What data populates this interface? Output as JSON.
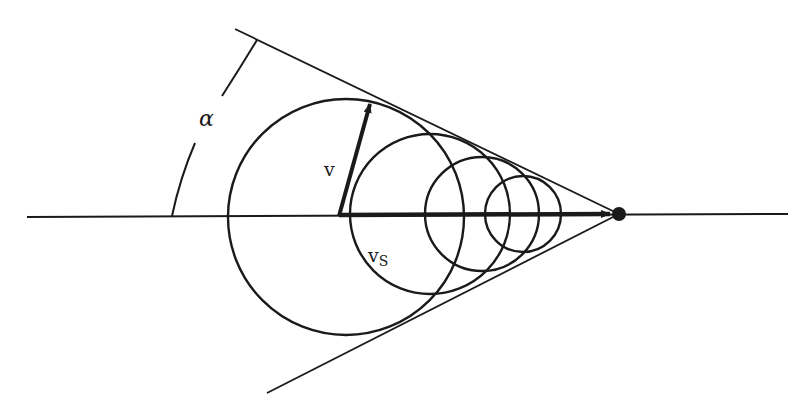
{
  "diagram": {
    "labels": {
      "angle": "α",
      "source_speed": "v",
      "sound_speed": "v",
      "sound_speed_subscript": "S"
    },
    "colors": {
      "stroke": "#1a1a1a",
      "background": "#ffffff"
    },
    "elements": {
      "axis": {
        "x1": 27,
        "y1": 217,
        "x2": 788,
        "y2": 214
      },
      "source_point": {
        "cx": 619,
        "cy": 214,
        "r": 7
      },
      "wavefronts": [
        {
          "cx": 346,
          "cy": 216,
          "r": 118
        },
        {
          "cx": 430,
          "cy": 214,
          "r": 80
        },
        {
          "cx": 482,
          "cy": 214,
          "r": 57
        },
        {
          "cx": 523,
          "cy": 214,
          "r": 38
        }
      ],
      "cone_upper": {
        "x1": 235,
        "y1": 29,
        "x2": 619,
        "y2": 214
      },
      "cone_lower": {
        "x1": 267,
        "y1": 393,
        "x2": 619,
        "y2": 214
      }
    }
  }
}
